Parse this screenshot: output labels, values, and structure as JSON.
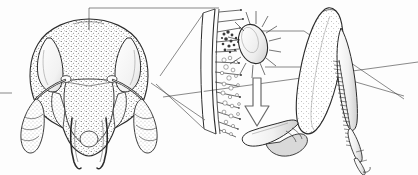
{
  "figure": {
    "caption": "",
    "width": 418,
    "height": 175,
    "background_color": "#fdfdfd",
    "ink_color": "#2b2b2b",
    "style": "stippled pen-and-ink scientific line drawing",
    "panel_count": 3
  },
  "panels": [
    {
      "id": "head",
      "name": "ant-head-frontal",
      "label": "",
      "view": "frontal",
      "bbox": [
        18,
        4,
        160,
        170
      ],
      "parts": [
        {
          "name": "head-capsule",
          "label": ""
        },
        {
          "name": "compound-eye-left",
          "label": ""
        },
        {
          "name": "compound-eye-right",
          "label": ""
        },
        {
          "name": "antenna-scape-left",
          "label": ""
        },
        {
          "name": "antenna-scape-right",
          "label": ""
        },
        {
          "name": "antenna-funiculus-left",
          "label": ""
        },
        {
          "name": "antenna-funiculus-right",
          "label": ""
        },
        {
          "name": "clypeus",
          "label": ""
        },
        {
          "name": "mandible-left",
          "label": ""
        },
        {
          "name": "mandible-right",
          "label": ""
        },
        {
          "name": "frontal-carina",
          "label": ""
        }
      ]
    },
    {
      "id": "cuticle-detail",
      "name": "magnified-cuticle-strip",
      "label": "",
      "view": "magnified cross-section",
      "bbox": [
        195,
        6,
        80,
        130
      ],
      "parts": [
        {
          "name": "cuticle-wall",
          "label": ""
        },
        {
          "name": "setae-hairs",
          "label": ""
        },
        {
          "name": "mite-body",
          "label": ""
        },
        {
          "name": "mite-setae",
          "label": ""
        },
        {
          "name": "debris-particles",
          "label": ""
        },
        {
          "name": "transfer-arrow",
          "label": ""
        }
      ]
    },
    {
      "id": "foreleg",
      "name": "foreleg-strigil",
      "label": "",
      "view": "lateral",
      "bbox": [
        255,
        6,
        160,
        168
      ],
      "parts": [
        {
          "name": "femur",
          "label": ""
        },
        {
          "name": "tibia",
          "label": ""
        },
        {
          "name": "strigil-comb",
          "label": ""
        },
        {
          "name": "basitarsus",
          "label": ""
        },
        {
          "name": "tarsal-segments",
          "label": ""
        },
        {
          "name": "pretarsal-claw",
          "label": ""
        },
        {
          "name": "coxa-trochanter",
          "label": ""
        }
      ]
    }
  ],
  "leaders": [
    {
      "name": "leader-head-vertex-to-detail",
      "from": "head-vertex",
      "to": "cuticle-detail-top"
    },
    {
      "name": "leader-head-lower-to-detail",
      "from": "head-lower",
      "to": "cuticle-detail-bottom"
    },
    {
      "name": "leader-mite-upper-to-comb",
      "from": "mite-body",
      "to": "strigil-comb"
    },
    {
      "name": "leader-mite-lower-to-comb",
      "from": "mite-setae",
      "to": "strigil-comb"
    },
    {
      "name": "leader-antenna-right-out",
      "from": "antenna-funiculus-right",
      "to": "right-margin"
    },
    {
      "name": "leader-left-margin-tick",
      "from": "left-margin",
      "to": "antenna-scape-left"
    }
  ],
  "annotations": {
    "arrow_direction": "down",
    "arrow_meaning": "debris transfer",
    "text_labels": []
  }
}
